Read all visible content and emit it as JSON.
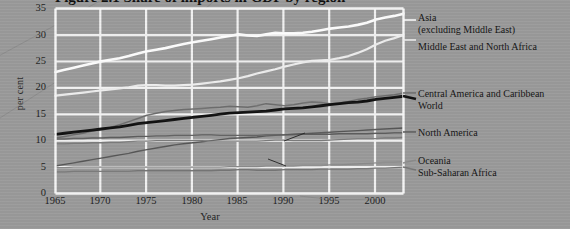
{
  "figure": {
    "title_clipped": "Figure 2.1  Share of imports in GDP by region",
    "background_color": "#9a9a9a",
    "grid_color": "#f2f2f2"
  },
  "axes": {
    "y": {
      "label": "per cent",
      "ticks": [
        "0",
        "5",
        "10",
        "15",
        "20",
        "25",
        "30",
        "35"
      ],
      "min": 0,
      "max": 35
    },
    "x": {
      "label": "Year",
      "ticks": [
        "1965",
        "1970",
        "1975",
        "1980",
        "1985",
        "1990",
        "1995",
        "2000"
      ],
      "min": 1965,
      "max": 2003
    }
  },
  "legend": [
    {
      "name": "legend-asia",
      "line1": "Asia",
      "line2": "(excluding Middle East)",
      "color": "#fdfdfd"
    },
    {
      "name": "legend-middle-east",
      "line1": "Middle East and North Africa",
      "line2": "",
      "color": "#ededed"
    },
    {
      "name": "legend-central-america",
      "line1": "Central America and Caribbean",
      "line2": "",
      "color": "#6e6e6e"
    },
    {
      "name": "legend-world",
      "line1": "World",
      "line2": "",
      "color": "#111111"
    },
    {
      "name": "legend-north-america",
      "line1": "North America",
      "line2": "",
      "color": "#5e5e5e"
    },
    {
      "name": "legend-oceania",
      "line1": "Oceania",
      "line2": "",
      "color": "#8b8b8b"
    },
    {
      "name": "legend-sub-saharan",
      "line1": "Sub-Saharan Africa",
      "line2": "",
      "color": "#767676"
    }
  ],
  "inplot_labels": [
    {
      "name": "label-europe",
      "text": "Europe"
    },
    {
      "name": "label-south-america",
      "text": "South America"
    }
  ],
  "chart_data": {
    "type": "line",
    "title": "Share of imports in GDP by region",
    "xlabel": "Year",
    "ylabel": "per cent",
    "xlim": [
      1965,
      2003
    ],
    "ylim": [
      0,
      35
    ],
    "grid": true,
    "legend_position": "right",
    "x": [
      1965,
      1966,
      1967,
      1968,
      1969,
      1970,
      1971,
      1972,
      1973,
      1974,
      1975,
      1976,
      1977,
      1978,
      1979,
      1980,
      1981,
      1982,
      1983,
      1984,
      1985,
      1986,
      1987,
      1988,
      1989,
      1990,
      1991,
      1992,
      1993,
      1994,
      1995,
      1996,
      1997,
      1998,
      1999,
      2000,
      2001,
      2002,
      2003
    ],
    "series": [
      {
        "name": "Asia (excluding Middle East)",
        "color": "#fdfdfd",
        "width": 2.6,
        "values": [
          23.0,
          23.4,
          23.8,
          24.2,
          24.6,
          25.0,
          25.3,
          25.6,
          26.0,
          26.5,
          26.9,
          27.2,
          27.5,
          27.9,
          28.3,
          28.6,
          28.9,
          29.2,
          29.5,
          29.8,
          30.1,
          29.9,
          29.8,
          30.1,
          30.4,
          30.3,
          30.3,
          30.4,
          30.6,
          30.9,
          31.2,
          31.4,
          31.6,
          31.9,
          32.3,
          32.9,
          33.3,
          33.6,
          34.0
        ]
      },
      {
        "name": "Middle East and North Africa",
        "color": "#ededed",
        "width": 2.2,
        "values": [
          18.5,
          18.7,
          18.9,
          19.1,
          19.3,
          19.5,
          19.7,
          19.9,
          20.1,
          20.4,
          20.5,
          20.5,
          20.4,
          20.4,
          20.5,
          20.6,
          20.8,
          21.0,
          21.2,
          21.5,
          21.8,
          22.2,
          22.7,
          23.1,
          23.5,
          24.0,
          24.4,
          24.8,
          25.1,
          25.2,
          25.3,
          25.6,
          26.0,
          26.6,
          27.3,
          28.2,
          28.9,
          29.4,
          30.0
        ]
      },
      {
        "name": "Central America and Caribbean",
        "color": "#6e6e6e",
        "width": 1.5,
        "values": [
          10.5,
          10.8,
          11.1,
          11.4,
          11.8,
          12.1,
          12.5,
          13.0,
          13.6,
          14.2,
          14.8,
          15.2,
          15.5,
          15.7,
          15.9,
          16.0,
          16.1,
          16.2,
          16.3,
          16.5,
          16.4,
          16.3,
          16.6,
          17.0,
          16.8,
          16.6,
          16.8,
          17.1,
          17.3,
          17.2,
          17.0,
          17.1,
          17.4,
          17.8,
          18.0,
          18.3,
          18.5,
          18.7,
          19.0
        ]
      },
      {
        "name": "World",
        "color": "#111111",
        "width": 2.8,
        "values": [
          11.2,
          11.4,
          11.6,
          11.8,
          12.0,
          12.2,
          12.4,
          12.6,
          12.9,
          13.2,
          13.4,
          13.6,
          13.8,
          14.0,
          14.2,
          14.4,
          14.6,
          14.8,
          15.0,
          15.2,
          15.3,
          15.4,
          15.5,
          15.6,
          15.8,
          16.0,
          16.1,
          16.2,
          16.4,
          16.6,
          16.8,
          17.0,
          17.2,
          17.3,
          17.5,
          17.8,
          18.0,
          18.2,
          18.4
        ]
      },
      {
        "name": "Europe",
        "color": "#575757",
        "width": 1.4,
        "values": [
          5.2,
          5.5,
          5.8,
          6.1,
          6.4,
          6.7,
          7.0,
          7.3,
          7.6,
          8.0,
          8.3,
          8.6,
          8.9,
          9.2,
          9.4,
          9.6,
          9.8,
          10.0,
          10.2,
          10.4,
          10.5,
          10.6,
          10.7,
          10.9,
          11.0,
          11.1,
          11.2,
          11.3,
          11.4,
          11.5,
          11.6,
          11.7,
          11.8,
          11.9,
          12.0,
          12.1,
          12.2,
          12.3,
          12.4
        ]
      },
      {
        "name": "North America",
        "color": "#5e5e5e",
        "width": 1.4,
        "values": [
          10.3,
          10.3,
          10.4,
          10.4,
          10.5,
          10.5,
          10.6,
          10.6,
          10.7,
          10.8,
          10.8,
          10.9,
          10.9,
          11.0,
          11.0,
          11.0,
          11.1,
          11.1,
          11.0,
          11.0,
          11.0,
          11.0,
          11.0,
          11.1,
          11.1,
          11.1,
          11.1,
          11.2,
          11.2,
          11.2,
          11.2,
          11.3,
          11.3,
          11.3,
          11.3,
          11.4,
          11.4,
          11.5,
          11.5
        ]
      },
      {
        "name": "South America",
        "color": "#7c7c7c",
        "width": 1.3,
        "values": [
          9.4,
          9.4,
          9.5,
          9.5,
          9.6,
          9.6,
          9.7,
          9.7,
          9.8,
          9.9,
          9.9,
          10.0,
          10.0,
          10.0,
          10.0,
          10.0,
          10.0,
          9.9,
          9.9,
          9.9,
          9.9,
          9.9,
          9.9,
          10.0,
          10.1,
          10.1,
          10.0,
          10.0,
          10.0,
          10.0,
          10.1,
          10.2,
          10.3,
          10.4,
          10.4,
          10.4,
          10.5,
          10.5,
          10.6
        ]
      },
      {
        "name": "Oceania",
        "color": "#8b8b8b",
        "width": 1.3,
        "values": [
          4.9,
          4.9,
          5.0,
          5.0,
          5.0,
          5.0,
          5.0,
          5.0,
          5.0,
          5.0,
          5.0,
          5.0,
          5.0,
          5.0,
          5.0,
          5.0,
          5.0,
          5.0,
          5.0,
          5.1,
          5.1,
          5.1,
          5.1,
          5.2,
          5.2,
          5.2,
          5.2,
          5.3,
          5.3,
          5.3,
          5.4,
          5.4,
          5.5,
          5.6,
          5.7,
          5.8,
          5.9,
          5.9,
          6.0
        ]
      },
      {
        "name": "Sub-Saharan Africa",
        "color": "#767676",
        "width": 1.3,
        "values": [
          4.1,
          4.1,
          4.2,
          4.2,
          4.2,
          4.2,
          4.2,
          4.2,
          4.2,
          4.3,
          4.3,
          4.3,
          4.3,
          4.3,
          4.3,
          4.3,
          4.3,
          4.3,
          4.4,
          4.4,
          4.5,
          4.5,
          4.4,
          4.4,
          4.4,
          4.5,
          4.5,
          4.5,
          4.5,
          4.6,
          4.6,
          4.6,
          4.6,
          4.7,
          4.7,
          4.8,
          4.8,
          4.9,
          5.0
        ]
      }
    ]
  }
}
